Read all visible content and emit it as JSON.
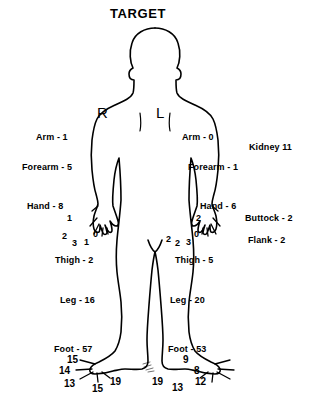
{
  "title": "TARGET",
  "side_markers": {
    "right": "R",
    "left": "L"
  },
  "left_column_labels": [
    {
      "text": "Arm - 1",
      "x": 36,
      "y": 133
    },
    {
      "text": "Forearm - 5",
      "x": 22,
      "y": 163
    },
    {
      "text": "Hand - 8",
      "x": 27,
      "y": 202
    },
    {
      "text": "Thigh - 2",
      "x": 55,
      "y": 256
    },
    {
      "text": "Leg - 16",
      "x": 60,
      "y": 296
    },
    {
      "text": "Foot - 57",
      "x": 54,
      "y": 345
    }
  ],
  "right_column_labels": [
    {
      "text": "Arm - 0",
      "x": 182,
      "y": 133
    },
    {
      "text": "Forearm - 1",
      "x": 188,
      "y": 163
    },
    {
      "text": "Hand - 6",
      "x": 200,
      "y": 202
    },
    {
      "text": "Thigh - 5",
      "x": 175,
      "y": 256
    },
    {
      "text": "Leg - 20",
      "x": 170,
      "y": 296
    },
    {
      "text": "Foot - 53",
      "x": 168,
      "y": 345
    }
  ],
  "far_right_labels": [
    {
      "text": "Kidney 11",
      "x": 249,
      "y": 143
    },
    {
      "text": "Buttock - 2",
      "x": 245,
      "y": 214
    },
    {
      "text": "Flank - 2",
      "x": 248,
      "y": 236
    }
  ],
  "left_hand_digits": [
    {
      "value": "1",
      "x": 67,
      "y": 214
    },
    {
      "value": "2",
      "x": 62,
      "y": 232
    },
    {
      "value": "3",
      "x": 72,
      "y": 239
    },
    {
      "value": "1",
      "x": 84,
      "y": 238
    },
    {
      "value": "0",
      "x": 93,
      "y": 230
    }
  ],
  "right_hand_digits": [
    {
      "value": "2",
      "x": 196,
      "y": 214
    },
    {
      "value": "2",
      "x": 166,
      "y": 235
    },
    {
      "value": "2",
      "x": 175,
      "y": 239
    },
    {
      "value": "3",
      "x": 186,
      "y": 238
    },
    {
      "value": "0",
      "x": 194,
      "y": 230
    }
  ],
  "left_foot_digits": [
    {
      "value": "15",
      "x": 67,
      "y": 355
    },
    {
      "value": "14",
      "x": 59,
      "y": 366
    },
    {
      "value": "13",
      "x": 64,
      "y": 379
    },
    {
      "value": "15",
      "x": 92,
      "y": 384
    },
    {
      "value": "19",
      "x": 110,
      "y": 377
    }
  ],
  "right_foot_digits": [
    {
      "value": "9",
      "x": 183,
      "y": 355
    },
    {
      "value": "8",
      "x": 194,
      "y": 366
    },
    {
      "value": "12",
      "x": 195,
      "y": 377
    },
    {
      "value": "13",
      "x": 172,
      "y": 383
    },
    {
      "value": "19",
      "x": 152,
      "y": 377
    }
  ],
  "colors": {
    "outline": "#000000",
    "background": "#ffffff",
    "text": "#000000"
  },
  "figure": {
    "stroke_width": 1.6
  }
}
